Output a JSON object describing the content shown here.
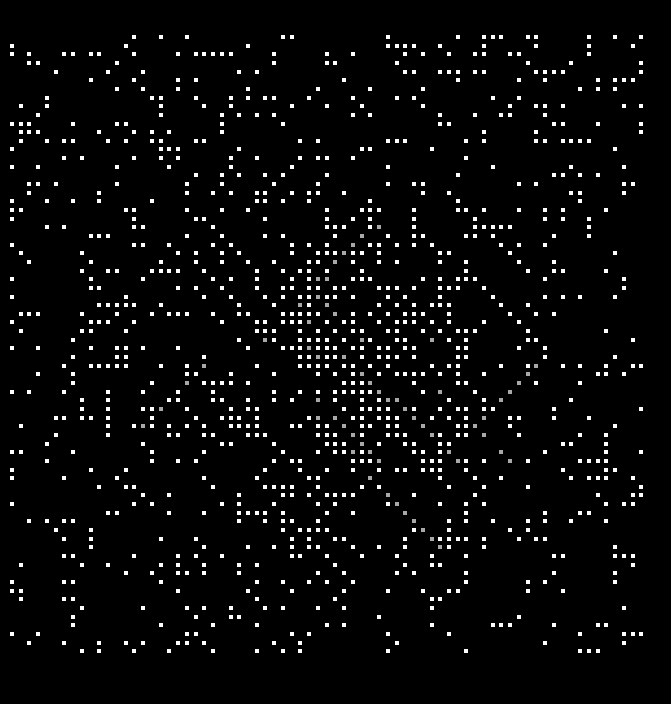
{
  "figure": {
    "kind": "recurrence-plot",
    "title": "",
    "width": 671,
    "height": 704,
    "background_color": "#000000"
  },
  "chart_data": {
    "type": "heatmap",
    "subtype": "recurrence-plot",
    "title": "",
    "subtitle": "",
    "xlabel": "",
    "ylabel": "",
    "legend": [],
    "annotations": [],
    "grid": false,
    "axes_visible": false,
    "tick_labels_x": [],
    "tick_labels_y": [],
    "plot_area": {
      "left": 10,
      "top": 35,
      "right": 648,
      "bottom": 658,
      "width": 638,
      "height": 623
    },
    "matrix": {
      "cols": 73,
      "rows": 72,
      "cell_width": 8.74,
      "cell_height": 8.65,
      "dot_size": 4,
      "dot_shape": "square",
      "fill_density": 0.22,
      "on_color": "#ffffff",
      "off_color": "#000000",
      "dim_color": "#a8a8a8",
      "xlim": [
        0,
        73
      ],
      "ylim": [
        0,
        72
      ]
    },
    "structure": {
      "diagonal_line_fraction": 0.16,
      "anti_diagonal_line_fraction": 0.07,
      "mean_diagonal_run_length": 4,
      "max_diagonal_run_length": 11,
      "center_bright_cell": [
        36,
        36
      ],
      "noise_fraction": 0.77,
      "description": "Sparse binary recurrence matrix: uniform random isolated points overlaid with short diagonal and anti-diagonal line segments radiating from the matrix centre."
    },
    "seed": 20240917
  }
}
